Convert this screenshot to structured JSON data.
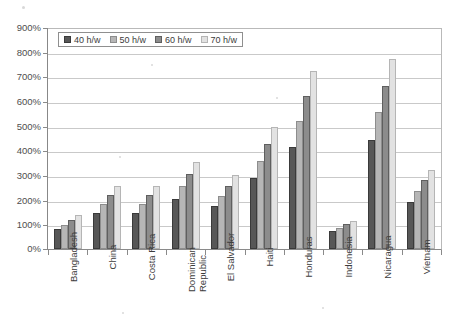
{
  "chart_data": {
    "type": "bar",
    "title": "",
    "subtitle": "",
    "xlabel": "",
    "ylabel": "",
    "ylim": [
      0,
      900
    ],
    "ytick_step": 100,
    "ytick_labels": [
      "0%",
      "100%",
      "200%",
      "300%",
      "400%",
      "500%",
      "600%",
      "700%",
      "800%",
      "900%"
    ],
    "grid": true,
    "legend_position": "top-left-inside",
    "categories": [
      "Bangladesh",
      "China",
      "Costa Rica",
      "Dominican Republic",
      "El Salvador",
      "Haiti",
      "Honduras",
      "Indonesia",
      "Nicaragua",
      "Vietnam"
    ],
    "series": [
      {
        "name": "40 h/w",
        "color": "#575757",
        "values": [
          80,
          148,
          149,
          206,
          174,
          291,
          419,
          73,
          447,
          192
        ]
      },
      {
        "name": "50 h/w",
        "color": "#b6b6b6",
        "values": [
          99,
          184,
          185,
          256,
          216,
          359,
          522,
          87,
          559,
          237
        ]
      },
      {
        "name": "60 h/w",
        "color": "#8c8c8c",
        "values": [
          118,
          219,
          222,
          308,
          257,
          430,
          625,
          104,
          668,
          283
        ]
      },
      {
        "name": "70 h/w",
        "color": "#e2e2e2",
        "values": [
          138,
          257,
          259,
          358,
          301,
          499,
          728,
          116,
          777,
          324
        ]
      }
    ]
  },
  "legend": {
    "items": [
      {
        "label": "40 h/w",
        "swatch": "legend-swatch-40"
      },
      {
        "label": "50 h/w",
        "swatch": "legend-swatch-50"
      },
      {
        "label": "60 h/w",
        "swatch": "legend-swatch-60"
      },
      {
        "label": "70 h/w",
        "swatch": "legend-swatch-70"
      }
    ]
  },
  "axis": {
    "y_labels": [
      "900%",
      "800%",
      "700%",
      "600%",
      "500%",
      "400%",
      "300%",
      "200%",
      "100%",
      "0%"
    ]
  }
}
